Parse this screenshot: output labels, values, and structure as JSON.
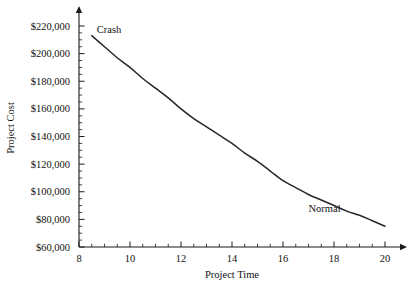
{
  "chart_data": {
    "type": "line",
    "title": "",
    "xlabel": "Project Time",
    "ylabel": "Project Cost",
    "xlim": [
      8,
      20
    ],
    "ylim": [
      60000,
      220000
    ],
    "grid": false,
    "legend": "none",
    "x_ticks": [
      8,
      10,
      12,
      14,
      16,
      18,
      20
    ],
    "x_tick_labels": [
      "8",
      "10",
      "12",
      "14",
      "16",
      "18",
      "20"
    ],
    "x_minor_step": 0.5,
    "y_ticks": [
      60000,
      80000,
      100000,
      120000,
      140000,
      160000,
      180000,
      200000,
      220000
    ],
    "y_tick_labels": [
      "$60,000",
      "$80,000",
      "$100,000",
      "$120,000",
      "$140,000",
      "$160,000",
      "$180,000",
      "$200,000",
      "$220,000"
    ],
    "y_minor_step": 5000,
    "series": [
      {
        "name": "project-cost-curve",
        "x": [
          8.5,
          9.0,
          9.5,
          10.0,
          10.5,
          11.0,
          11.5,
          12.0,
          12.5,
          13.0,
          13.5,
          14.0,
          14.5,
          15.0,
          15.5,
          16.0,
          16.5,
          17.0,
          17.5,
          18.0,
          18.5,
          19.0,
          19.5,
          20.0
        ],
        "y": [
          213000,
          205000,
          197000,
          190000,
          182000,
          175000,
          168000,
          160000,
          153000,
          147000,
          141000,
          135000,
          128000,
          122000,
          115000,
          108000,
          103000,
          98000,
          94000,
          90000,
          86000,
          83000,
          79000,
          75000
        ]
      }
    ],
    "annotations": [
      {
        "label": "Crash",
        "x": 8.7,
        "y": 215000
      },
      {
        "label": "Normal",
        "x": 17.0,
        "y": 85000
      }
    ],
    "colors": {
      "curve": "#26262b",
      "axis": "#1a1a1a",
      "text": "#111111",
      "background": "#ffffff"
    }
  }
}
